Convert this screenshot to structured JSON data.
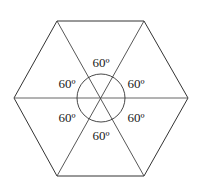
{
  "diagram": {
    "type": "regular hexagon divided into six equilateral triangles",
    "center_circle": true,
    "angles": [
      {
        "position": "top",
        "label": "60º"
      },
      {
        "position": "upper-left",
        "label": "60º"
      },
      {
        "position": "upper-right",
        "label": "60º"
      },
      {
        "position": "lower-left",
        "label": "60º"
      },
      {
        "position": "lower-right",
        "label": "60º"
      },
      {
        "position": "bottom",
        "label": "60º"
      }
    ],
    "colors": {
      "stroke": "#333333",
      "background": "#ffffff",
      "text": "#1a1a1a"
    }
  }
}
